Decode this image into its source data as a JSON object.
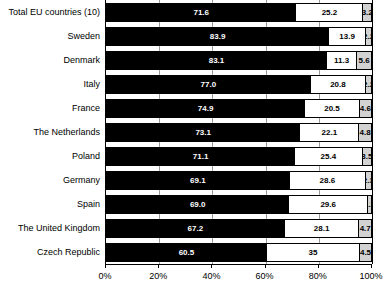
{
  "chart_data": {
    "type": "bar",
    "orientation": "horizontal",
    "stacked": true,
    "title": "",
    "subtitle": "",
    "xlabel": "",
    "ylabel": "",
    "xlim": [
      0,
      100
    ],
    "grid": true,
    "legend_position": "none",
    "xticks": [
      "0%",
      "20%",
      "40%",
      "60%",
      "80%",
      "100%"
    ],
    "xtick_values": [
      0,
      20,
      40,
      60,
      80,
      100
    ],
    "categories": [
      "Total EU countries (10)",
      "Sweden",
      "Denmark",
      "Italy",
      "France",
      "The Netherlands",
      "Poland",
      "Germany",
      "Spain",
      "The United Kingdom",
      "Czech Republic"
    ],
    "series": [
      {
        "name": "segment-1",
        "color": "#000000",
        "label_color": "#ffffff",
        "values": [
          71.6,
          83.9,
          83.1,
          77.0,
          74.9,
          73.1,
          71.1,
          69.1,
          69.0,
          67.2,
          60.5
        ],
        "labels": [
          "71.6",
          "83.9",
          "83.1",
          "77.0",
          "74.9",
          "73.1",
          "71.1",
          "69.1",
          "69.0",
          "67.2",
          "60.5"
        ]
      },
      {
        "name": "segment-2",
        "color": "#ffffff",
        "label_color": "#000000",
        "values": [
          25.2,
          13.9,
          11.3,
          20.8,
          20.5,
          22.1,
          25.4,
          28.6,
          29.6,
          28.1,
          35.0
        ],
        "labels": [
          "25.2",
          "13.9",
          "11.3",
          "20.8",
          "20.5",
          "22.1",
          "25.4",
          "28.6",
          "29.6",
          "28.1",
          "35"
        ]
      },
      {
        "name": "segment-3",
        "color": "#d2d2d2",
        "label_color": "#000000",
        "values": [
          3.2,
          2.2,
          5.6,
          2.2,
          4.6,
          4.8,
          3.5,
          2.3,
          1.5,
          4.7,
          4.5
        ],
        "labels": [
          "3.2",
          "2.2",
          "5.6",
          "2.2",
          "4.6",
          "4.8",
          "3.5",
          "2.3",
          "1.5",
          "4.7",
          "4.5"
        ]
      }
    ]
  }
}
